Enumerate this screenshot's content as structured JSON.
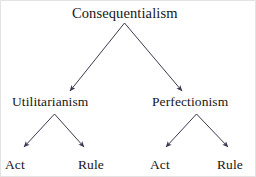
{
  "diagram": {
    "type": "tree",
    "title_text": "Consequentialism",
    "stroke_color": "#3a3a52",
    "text_color": "#161616",
    "background_color": "#ffffff",
    "border_color": "#e3e3e3",
    "root": {
      "label": "Consequentialism"
    },
    "level_two": [
      {
        "label": "Utilitarianism"
      },
      {
        "label": "Perfectionism"
      }
    ],
    "leaves": [
      {
        "label": "Act"
      },
      {
        "label": "Rule"
      },
      {
        "label": "Act"
      },
      {
        "label": "Rule"
      }
    ],
    "edges": [
      {
        "from": "Consequentialism",
        "to": "Utilitarianism"
      },
      {
        "from": "Consequentialism",
        "to": "Perfectionism"
      },
      {
        "from": "Utilitarianism",
        "to": "Act"
      },
      {
        "from": "Utilitarianism",
        "to": "Rule"
      },
      {
        "from": "Perfectionism",
        "to": "Act"
      },
      {
        "from": "Perfectionism",
        "to": "Rule"
      }
    ]
  }
}
